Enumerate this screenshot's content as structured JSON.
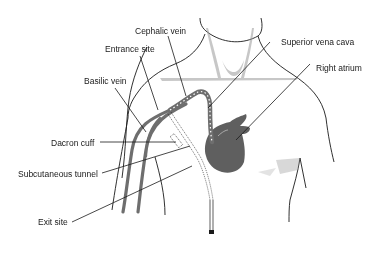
{
  "diagram": {
    "type": "anatomical-illustration",
    "labels": {
      "cephalic_vein": "Cephalic vein",
      "entrance_site": "Entrance site",
      "basilic_vein": "Basilic vein",
      "superior_vena_cava": "Superior vena cava",
      "right_atrium": "Right atrium",
      "dacron_cuff": "Dacron cuff",
      "subcutaneous_tunnel": "Subcutaneous tunnel",
      "exit_site": "Exit site"
    },
    "colors": {
      "outline": "#1a1a1a",
      "vein": "#6e6e6e",
      "heart": "#5f5f5f",
      "shading": "#9a9a9a",
      "catheter_dots": "#ffffff"
    }
  }
}
